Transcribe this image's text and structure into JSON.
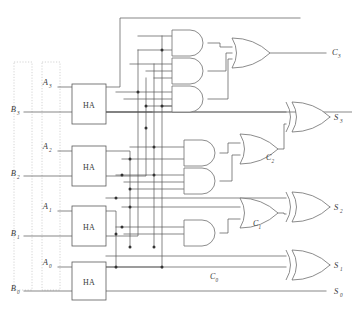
{
  "diagram": {
    "kind": "logic-circuit-schematic",
    "canvas": {
      "width": 352,
      "height": 314
    },
    "colors": {
      "background": "#ffffff",
      "wire": "#555555",
      "gate_outline": "#6e6e6e",
      "box_outline": "#5a5a5a",
      "label_text": "#3a3a3a",
      "bus_dotted": "#c8c8c8",
      "junction_dot": "#333333"
    },
    "inputs": [
      {
        "name": "A3",
        "base": "A",
        "sub": "3",
        "x": 52,
        "y": 82
      },
      {
        "name": "B3",
        "base": "B",
        "sub": "3",
        "x": 16,
        "y": 112
      },
      {
        "name": "A2",
        "base": "A",
        "sub": "2",
        "x": 52,
        "y": 146
      },
      {
        "name": "B2",
        "base": "B",
        "sub": "2",
        "x": 16,
        "y": 176
      },
      {
        "name": "A1",
        "base": "A",
        "sub": "1",
        "x": 52,
        "y": 206
      },
      {
        "name": "B1",
        "base": "B",
        "sub": "1",
        "x": 16,
        "y": 236
      },
      {
        "name": "A0",
        "base": "A",
        "sub": "0",
        "x": 52,
        "y": 262
      },
      {
        "name": "B0",
        "base": "B",
        "sub": "0",
        "x": 16,
        "y": 290
      }
    ],
    "outputs": [
      {
        "name": "C3",
        "base": "C",
        "sub": "3",
        "x": 334,
        "y": 50
      },
      {
        "name": "S3",
        "base": "S",
        "sub": "3",
        "x": 334,
        "y": 118
      },
      {
        "name": "S2",
        "base": "S",
        "sub": "2",
        "x": 334,
        "y": 208
      },
      {
        "name": "S1",
        "base": "S",
        "sub": "1",
        "x": 334,
        "y": 266
      },
      {
        "name": "S0",
        "base": "S",
        "sub": "0",
        "x": 334,
        "y": 292
      }
    ],
    "internal_labels": [
      {
        "name": "C2",
        "base": "C",
        "sub": "2",
        "x": 268,
        "y": 156
      },
      {
        "name": "C1",
        "base": "C",
        "sub": "1",
        "x": 255,
        "y": 224
      },
      {
        "name": "C0",
        "base": "C",
        "sub": "0",
        "x": 213,
        "y": 277
      }
    ],
    "half_adders": [
      {
        "label": "HA",
        "bit": "3",
        "x": 72,
        "y": 84,
        "w": 34,
        "h": 40
      },
      {
        "label": "HA",
        "bit": "2",
        "x": 72,
        "y": 146,
        "w": 34,
        "h": 40
      },
      {
        "label": "HA",
        "bit": "1",
        "x": 72,
        "y": 206,
        "w": 34,
        "h": 40
      },
      {
        "label": "HA",
        "bit": "0",
        "x": 72,
        "y": 262,
        "w": 34,
        "h": 38
      }
    ],
    "gates": [
      {
        "id": "and-c3-a",
        "type": "AND",
        "x": 172,
        "y": 30,
        "w": 36,
        "h": 26,
        "inputs": 2
      },
      {
        "id": "and-c3-b",
        "type": "AND",
        "x": 172,
        "y": 58,
        "w": 36,
        "h": 26,
        "inputs": 3
      },
      {
        "id": "and-c3-c",
        "type": "AND",
        "x": 172,
        "y": 86,
        "w": 36,
        "h": 26,
        "inputs": 4
      },
      {
        "id": "or-c3",
        "type": "OR",
        "x": 232,
        "y": 38,
        "w": 38,
        "h": 30,
        "inputs": 3
      },
      {
        "id": "and-c2-a",
        "type": "AND",
        "x": 184,
        "y": 140,
        "w": 36,
        "h": 26,
        "inputs": 2
      },
      {
        "id": "and-c2-b",
        "type": "AND",
        "x": 184,
        "y": 168,
        "w": 36,
        "h": 26,
        "inputs": 3
      },
      {
        "id": "or-c2",
        "type": "OR",
        "x": 240,
        "y": 134,
        "w": 38,
        "h": 30,
        "inputs": 2
      },
      {
        "id": "and-c1",
        "type": "AND",
        "x": 184,
        "y": 220,
        "w": 36,
        "h": 26,
        "inputs": 2
      },
      {
        "id": "or-c1",
        "type": "OR",
        "x": 240,
        "y": 198,
        "w": 38,
        "h": 30,
        "inputs": 2
      },
      {
        "id": "xor-s3",
        "type": "XOR",
        "x": 292,
        "y": 102,
        "w": 38,
        "h": 30,
        "inputs": 2
      },
      {
        "id": "xor-s2",
        "type": "XOR",
        "x": 292,
        "y": 192,
        "w": 38,
        "h": 30,
        "inputs": 2
      },
      {
        "id": "xor-s1",
        "type": "XOR",
        "x": 292,
        "y": 250,
        "w": 38,
        "h": 30,
        "inputs": 2
      }
    ],
    "bus_columns": [
      {
        "name": "B-bus",
        "x": 14,
        "y": 62,
        "w": 18,
        "h": 228
      },
      {
        "name": "A-bus",
        "x": 42,
        "y": 62,
        "w": 18,
        "h": 228
      }
    ]
  }
}
